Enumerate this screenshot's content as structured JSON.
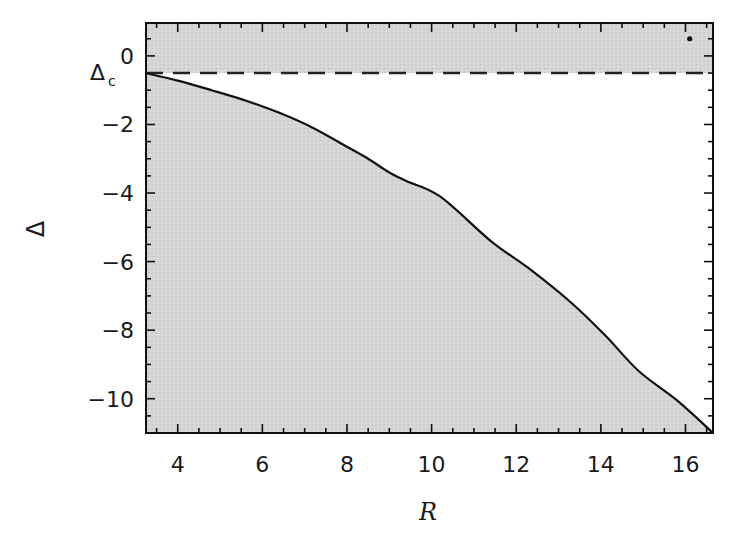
{
  "chart_data": {
    "type": "area",
    "title": "",
    "xlabel": "R",
    "ylabel": "Δ",
    "xlim": [
      3.25,
      16.65
    ],
    "ylim": [
      -11,
      0.96
    ],
    "grid": false,
    "legend": null,
    "x_ticks": [
      4,
      6,
      8,
      10,
      12,
      14,
      16
    ],
    "x_tick_labels": [
      "4",
      "6",
      "8",
      "10",
      "12",
      "14",
      "16"
    ],
    "x_minor_step": 0.5,
    "y_ticks": [
      0,
      -2,
      -4,
      -6,
      -8,
      -10
    ],
    "y_tick_labels": [
      "0",
      "−2",
      "−4",
      "−6",
      "−8",
      "−10"
    ],
    "y_minor_step": 0.5,
    "series": [
      {
        "name": "boundary curve",
        "style": "solid",
        "x": [
          3.25,
          4.0,
          4.8,
          5.6,
          6.4,
          7.2,
          8.0,
          8.5,
          9.0,
          9.4,
          10.2,
          11.4,
          12.3,
          13.3,
          14.1,
          14.9,
          15.8,
          16.65
        ],
        "y": [
          -0.5,
          -0.72,
          -1.0,
          -1.3,
          -1.66,
          -2.1,
          -2.65,
          -3.0,
          -3.4,
          -3.65,
          -4.1,
          -5.4,
          -6.2,
          -7.2,
          -8.15,
          -9.2,
          -10.05,
          -11.0
        ]
      },
      {
        "name": "Δc",
        "style": "dashed",
        "x": [
          3.25,
          16.65
        ],
        "y": [
          -0.5,
          -0.5
        ]
      }
    ],
    "shaded_regions": [
      {
        "description": "region above Δc dashed line (Δ > Δc)",
        "color": "#d4d4d4"
      },
      {
        "description": "region below the solid curve",
        "color": "#d4d4d4"
      }
    ],
    "annotations": [
      {
        "text": "Δ",
        "subscript": "c",
        "near": "y = -0.5 left of axis",
        "meaning": "critical value Δc ≈ -0.5"
      },
      {
        "text": "•",
        "x": 16.1,
        "y": 0.5,
        "meaning": "small dot marker near top-right"
      }
    ]
  },
  "labels": {
    "xlabel": "R",
    "ylabel": "Δ",
    "delta_c_main": "Δ",
    "delta_c_sub": "c"
  },
  "colors": {
    "shade": "#d2d2d2",
    "line": "#111111",
    "background": "#ffffff"
  }
}
